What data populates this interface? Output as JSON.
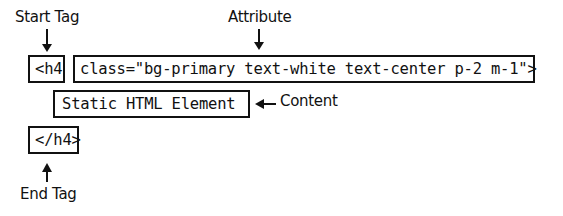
{
  "labels": {
    "start_tag": "Start Tag",
    "attribute": "Attribute",
    "content": "Content",
    "end_tag": "End Tag"
  },
  "boxes": {
    "open_tag": "<h4",
    "attribute": "class=\"bg-primary text-white text-center p-2 m-1\">",
    "content": "Static HTML Element",
    "close_tag": "</h4>"
  }
}
